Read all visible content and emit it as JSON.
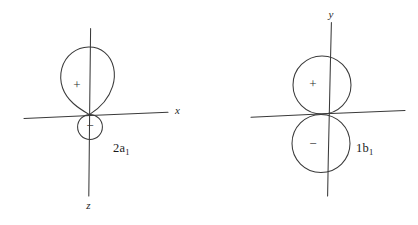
{
  "figure": {
    "kind": "molecular-orbital-sketch",
    "background_color": "#ffffff",
    "ink_color": "#3a3a3a",
    "diagrams": [
      {
        "id": "2a1",
        "label_main": "2a",
        "label_sub": "1",
        "label_full": "2a1",
        "description": "Large positive teardrop lobe above origin with small negative circle below origin",
        "axes": [
          {
            "name": "horizontal-axis",
            "label": "x"
          },
          {
            "name": "vertical-axis",
            "label": "z"
          }
        ],
        "lobes": [
          {
            "name": "upper-lobe",
            "sign": "+",
            "shape": "teardrop",
            "size": "large"
          },
          {
            "name": "lower-lobe",
            "sign": "−",
            "shape": "circle",
            "size": "small"
          }
        ]
      },
      {
        "id": "1b1",
        "label_main": "1b",
        "label_sub": "1",
        "label_full": "1b1",
        "description": "Two equal tangent circles, positive above origin and negative below origin",
        "axes": [
          {
            "name": "horizontal-axis",
            "label": ""
          },
          {
            "name": "vertical-axis",
            "label": "y"
          }
        ],
        "lobes": [
          {
            "name": "upper-lobe",
            "sign": "+",
            "shape": "circle",
            "size": "medium"
          },
          {
            "name": "lower-lobe",
            "sign": "−",
            "shape": "circle",
            "size": "medium"
          }
        ]
      }
    ]
  }
}
